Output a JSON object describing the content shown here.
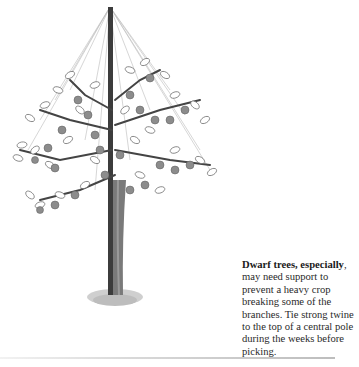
{
  "illustration": {
    "subject": "dwarf fruit tree supported by twine tied to a central pole",
    "colors": {
      "pole": "#3a3a3a",
      "twine": "#b8b8b8",
      "leaf_outline": "#6a6a6a",
      "fruit": "#8a8a8a",
      "ground": "#c8c8c8"
    }
  },
  "caption": {
    "lead": "Dwarf trees, especially",
    "body": ", may need support to prevent a heavy crop breaking some of the branches. Tie strong twine to the top of a central pole during the weeks before picking."
  }
}
